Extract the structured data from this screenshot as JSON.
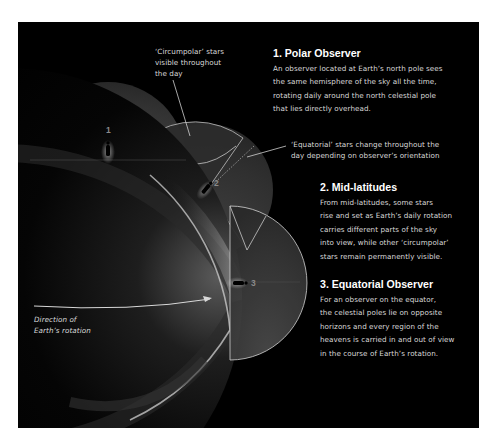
{
  "colors": {
    "background": "#ffffff",
    "panel": "#000000",
    "heading_text": "#ffffff",
    "body_text": "#d9d9d9",
    "outline": "#c8c8c8",
    "dome_fill": "#3a3a3a",
    "observer_number": "#8a8a8a"
  },
  "callouts": {
    "circumpolar": [
      "‘Circumpolar’ stars",
      "visible throughout",
      "the day"
    ],
    "equatorial": [
      "‘Equatorial’ stars change throughout the",
      "day depending on observer’s orientation"
    ],
    "rotation": [
      "Direction of",
      "Earth’s rotation"
    ]
  },
  "sections": [
    {
      "heading": "1. Polar Observer",
      "lines": [
        "An observer located at Earth’s north pole sees",
        "the same hemisphere of the sky all the time,",
        "rotating daily around the north celestial pole",
        "that lies directly overhead."
      ]
    },
    {
      "heading": "2. Mid-latitudes",
      "lines": [
        "From mid-latitudes, some stars",
        "rise and set as Earth’s daily rotation",
        "carries different parts of the sky",
        "into view, while other ‘circumpolar’",
        "stars remain permanently visible."
      ]
    },
    {
      "heading": "3. Equatorial Observer",
      "lines": [
        "For an observer on the equator,",
        "the celestial poles lie on opposite",
        "horizons and every region of the",
        "heavens is carried in and out of view",
        "in the course of Earth’s rotation."
      ]
    }
  ],
  "observers": [
    {
      "label": "1",
      "position": "north pole"
    },
    {
      "label": "2",
      "position": "mid-latitude"
    },
    {
      "label": "3",
      "position": "equator"
    }
  ],
  "icons": {
    "observer": "person-silhouette-icon",
    "rotation_arrow": "arrow-right-icon",
    "earth": "earth-globe-icon"
  }
}
